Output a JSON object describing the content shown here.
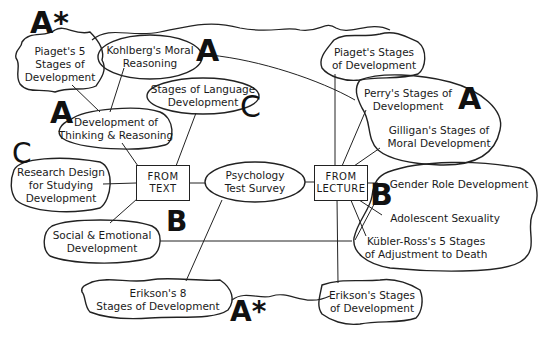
{
  "diagram": {
    "center": {
      "label_lines": [
        "Psychology",
        "Test Survey"
      ]
    },
    "hubs": {
      "text": {
        "label_lines": [
          "FROM",
          "TEXT"
        ]
      },
      "lecture": {
        "label_lines": [
          "FROM",
          "LECTURE"
        ]
      }
    },
    "text_topics": [
      {
        "id": "piaget5",
        "label_lines": [
          "Piaget's 5",
          "Stages of",
          "Development"
        ],
        "grade": "A*"
      },
      {
        "id": "kohlberg",
        "label_lines": [
          "Kohlberg's Moral",
          "Reasoning"
        ],
        "grade": "A"
      },
      {
        "id": "language",
        "label_lines": [
          "Stages of Language",
          "Development"
        ],
        "grade": "C"
      },
      {
        "id": "thinking",
        "label_lines": [
          "Development of",
          "Thinking & Reasoning"
        ],
        "grade": "A"
      },
      {
        "id": "research",
        "label_lines": [
          "Research Design",
          "for Studying",
          "Development"
        ],
        "grade": "C"
      },
      {
        "id": "social",
        "label_lines": [
          "Social & Emotional",
          "Development"
        ],
        "grade": "B"
      },
      {
        "id": "erikson8",
        "label_lines": [
          "Erikson's 8",
          "Stages of Development"
        ],
        "grade": "A*"
      }
    ],
    "lecture_topics": [
      {
        "id": "piagetStages",
        "label_lines": [
          "Piaget's Stages",
          "of Development"
        ]
      },
      {
        "id": "perry",
        "label_lines": [
          "Perry's Stages of",
          "Development"
        ]
      },
      {
        "id": "gilligan",
        "label_lines": [
          "Gilligan's Stages of",
          "Moral Development"
        ]
      },
      {
        "id": "gender",
        "label_lines": [
          "Gender Role Development"
        ]
      },
      {
        "id": "adolescent",
        "label_lines": [
          "Adolescent Sexuality"
        ]
      },
      {
        "id": "kubler",
        "label_lines": [
          "Kübler-Ross's 5 Stages",
          "of Adjustment to Death"
        ]
      },
      {
        "id": "eriksonStages",
        "label_lines": [
          "Erikson's Stages",
          "of Development"
        ]
      }
    ],
    "group_grades": {
      "perry_gilligan": "A",
      "gender_adolescent_kubler": "B"
    },
    "colors": {
      "ink": "#111111",
      "background": "#ffffff"
    }
  }
}
